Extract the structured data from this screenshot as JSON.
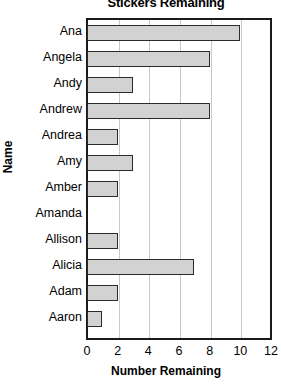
{
  "chart_data": {
    "type": "bar",
    "orientation": "horizontal",
    "title": "Stickers Remaining",
    "xlabel": "Number Remaining",
    "ylabel": "Name",
    "categories": [
      "Ana",
      "Angela",
      "Andy",
      "Andrew",
      "Andrea",
      "Amy",
      "Amber",
      "Amanda",
      "Allison",
      "Alicia",
      "Adam",
      "Aaron"
    ],
    "values": [
      10,
      8,
      3,
      8,
      2,
      3,
      2,
      0,
      2,
      7,
      2,
      1
    ],
    "xlim": [
      0,
      12
    ],
    "xticks": [
      0,
      2,
      4,
      6,
      8,
      10,
      12
    ],
    "xtick_labels": [
      "0",
      "2",
      "4",
      "6",
      "8",
      "10",
      "12"
    ],
    "grid": "vertical",
    "legend": "none",
    "bar_fill_color": "#d2d2d2",
    "bar_border_color": "#2b2b2b",
    "axis_color": "#1a1a1a",
    "gridline_color": "#c8c8c8"
  }
}
